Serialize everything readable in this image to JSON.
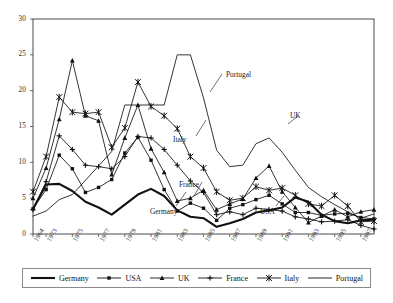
{
  "chart_data": {
    "type": "line",
    "title": "",
    "xlabel": "",
    "ylabel": "",
    "ylim": [
      0,
      30
    ],
    "yticks": [
      0,
      5,
      10,
      15,
      20,
      25,
      30
    ],
    "grid": false,
    "legend_position": "bottom",
    "x": [
      1964,
      1973,
      1974,
      1975,
      1976,
      1977,
      1978,
      1979,
      1980,
      1981,
      1982,
      1983,
      1984,
      1985,
      1986,
      1987,
      1988,
      1989,
      1990,
      1991,
      1992,
      1993,
      1994,
      1995,
      1996,
      1997,
      1998
    ],
    "xticks": [
      "1964",
      "1973",
      "1975",
      "1977",
      "1979",
      "1981",
      "1983",
      "1985",
      "1987",
      "1989",
      "1991",
      "1993",
      "1995",
      "1997"
    ],
    "series": [
      {
        "name": "Germany",
        "marker": "none",
        "width": "thick",
        "color": "#111111",
        "values": [
          3.5,
          6.9,
          7.0,
          6.0,
          4.5,
          3.7,
          2.7,
          4.1,
          5.5,
          6.3,
          5.3,
          3.3,
          2.4,
          2.2,
          1.0,
          1.5,
          2.1,
          3.0,
          3.3,
          3.7,
          5.1,
          4.5,
          2.7,
          1.8,
          1.5,
          1.9,
          2.0
        ]
      },
      {
        "name": "USA",
        "marker": "diamond",
        "width": "thin",
        "color": "#111111",
        "values": [
          3.5,
          6.2,
          11.0,
          9.1,
          5.8,
          6.5,
          7.6,
          11.3,
          13.5,
          10.3,
          6.2,
          3.2,
          4.3,
          3.6,
          1.9,
          3.6,
          4.1,
          4.8,
          5.4,
          4.2,
          3.0,
          3.0,
          2.6,
          2.8,
          2.9,
          2.3,
          2.1
        ]
      },
      {
        "name": "UK",
        "marker": "triangle",
        "width": "thin",
        "color": "#111111",
        "values": [
          5.0,
          9.2,
          16.0,
          24.2,
          16.5,
          15.8,
          8.3,
          13.4,
          18.0,
          11.9,
          8.6,
          4.6,
          5.0,
          6.1,
          3.4,
          4.2,
          4.9,
          7.8,
          9.5,
          5.9,
          3.7,
          1.6,
          2.5,
          3.4,
          2.4,
          3.1,
          3.4
        ]
      },
      {
        "name": "France",
        "marker": "plus",
        "width": "thin",
        "color": "#111111",
        "values": [
          3.4,
          7.3,
          13.7,
          11.8,
          9.6,
          9.4,
          9.1,
          10.8,
          13.6,
          13.4,
          11.8,
          9.6,
          7.4,
          5.8,
          2.7,
          3.1,
          2.7,
          3.6,
          3.4,
          3.2,
          2.4,
          2.1,
          1.7,
          1.8,
          2.0,
          1.2,
          0.7
        ]
      },
      {
        "name": "Italy",
        "marker": "star",
        "width": "thin",
        "color": "#111111",
        "values": [
          5.9,
          10.8,
          19.1,
          17.0,
          16.8,
          17.0,
          12.1,
          14.8,
          21.2,
          17.8,
          16.5,
          14.7,
          10.8,
          9.2,
          5.9,
          4.7,
          5.0,
          6.6,
          6.1,
          6.4,
          5.4,
          4.2,
          3.9,
          5.4,
          3.9,
          1.7,
          1.8
        ]
      },
      {
        "name": "Portugal",
        "marker": "none",
        "width": "thin",
        "color": "#111111",
        "values": [
          2.5,
          3.2,
          4.8,
          5.5,
          7.5,
          9.5,
          11.5,
          18.0,
          18.0,
          18.0,
          18.0,
          25.0,
          25.0,
          19.0,
          11.7,
          9.4,
          9.6,
          12.6,
          13.4,
          11.4,
          8.9,
          6.5,
          5.2,
          4.1,
          3.1,
          2.2,
          2.8
        ]
      }
    ],
    "annotations": [
      {
        "label": "Portugal",
        "x": 226,
        "y": 70
      },
      {
        "label": "Italy",
        "x": 173,
        "y": 135
      },
      {
        "label": "UK",
        "x": 290,
        "y": 111
      },
      {
        "label": "France",
        "x": 179,
        "y": 180
      },
      {
        "label": "Germany",
        "x": 150,
        "y": 207
      },
      {
        "label": "USA",
        "x": 260,
        "y": 207
      }
    ]
  },
  "legend": {
    "items": [
      {
        "label": "Germany",
        "key": "line-thick"
      },
      {
        "label": "USA",
        "key": "line-diamond"
      },
      {
        "label": "UK",
        "key": "line-triangle"
      },
      {
        "label": "France",
        "key": "line-plus"
      },
      {
        "label": "Italy",
        "key": "line-star"
      },
      {
        "label": "Portugal",
        "key": "line-plain"
      }
    ]
  },
  "caption": ""
}
